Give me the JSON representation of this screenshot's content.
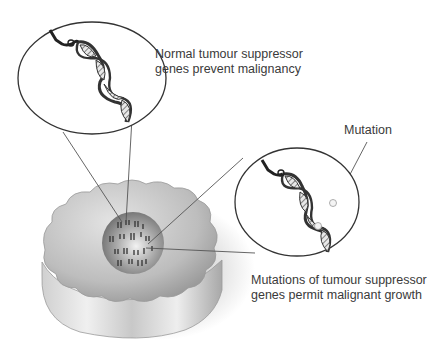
{
  "diagram": {
    "labels": {
      "normal_line1": "Normal tumour suppressor",
      "normal_line2": "genes prevent malignancy",
      "mutation": "Mutation",
      "mutated_line1": "Mutations of tumour suppressor",
      "mutated_line2": "genes permit malignant growth"
    },
    "elements": {
      "cell": "cell with wavy cytoplasm",
      "nucleus": "nucleus with chromosomes",
      "normal_dna_callout": "magnified normal DNA double helix",
      "mutated_dna_callout": "magnified mutated DNA double helix"
    },
    "colors": {
      "outline": "#333333",
      "cell": "#c8c8c8",
      "nucleus": "#8a8a8a",
      "text": "#3a3a3a"
    }
  }
}
